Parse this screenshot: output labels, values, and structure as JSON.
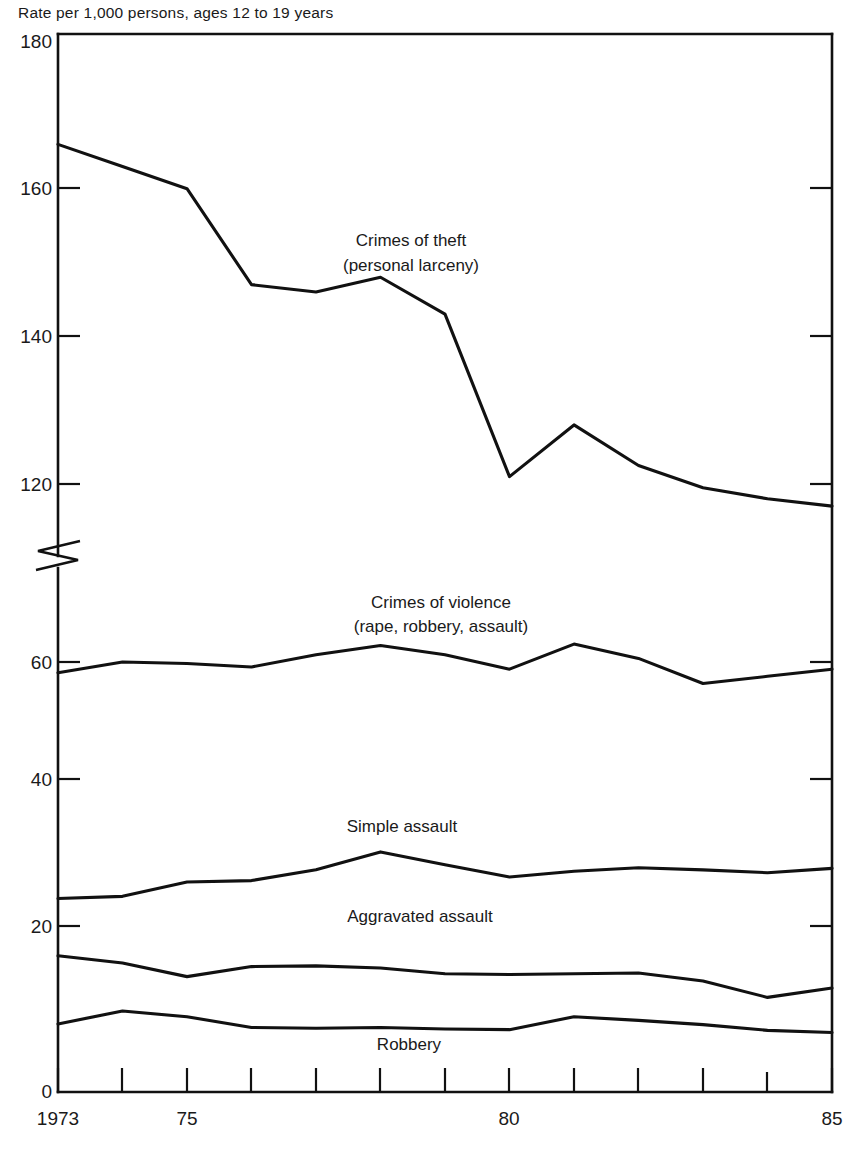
{
  "figure": {
    "subtitle": "Rate per 1,000 persons, ages 12 to 19 years"
  },
  "axes": {
    "y_ticks_upper": [
      "180",
      "160",
      "140",
      "120"
    ],
    "y_ticks_lower": [
      "60",
      "40",
      "20",
      "0"
    ],
    "x_ticks_labeled": [
      "1973",
      "75",
      "80",
      "85"
    ],
    "y_break": true
  },
  "series_labels": {
    "theft_line1": "Crimes of theft",
    "theft_line2": "(personal larceny)",
    "violence_line1": "Crimes of violence",
    "violence_line2": "(rape, robbery, assault)",
    "simple_assault": "Simple assault",
    "aggravated_assault": "Aggravated assault",
    "robbery": "Robbery"
  },
  "chart_data": {
    "type": "line",
    "title": "",
    "subtitle": "Rate per 1,000 persons, ages 12 to 19 years",
    "xlabel": "",
    "ylabel": "Rate per 1,000 persons, ages 12 to 19 years",
    "grid": false,
    "legend": "inline-annotations",
    "x": [
      1973,
      1974,
      1975,
      1976,
      1977,
      1978,
      1979,
      1980,
      1981,
      1982,
      1983,
      1984,
      1985
    ],
    "xtick_labels": {
      "1973": "1973",
      "1975": "75",
      "1980": "80",
      "1985": "85"
    },
    "y_axis_break": {
      "lower_range": [
        0,
        70
      ],
      "upper_range": [
        110,
        180
      ],
      "break_between": [
        70,
        110
      ]
    },
    "ylim_lower": [
      0,
      70
    ],
    "ylim_upper": [
      110,
      180
    ],
    "y_ticks": [
      0,
      20,
      40,
      60,
      120,
      140,
      160,
      180
    ],
    "series": [
      {
        "name": "Crimes of theft (personal larceny)",
        "values": [
          166.0,
          163.0,
          160.0,
          147.0,
          146.0,
          148.0,
          143.0,
          121.0,
          128.0,
          122.5,
          119.5,
          118.0,
          117.0
        ]
      },
      {
        "name": "Crimes of violence (rape, robbery, assault)",
        "values": [
          58.5,
          60.0,
          59.8,
          59.3,
          61.0,
          62.3,
          61.0,
          59.0,
          62.5,
          60.5,
          57.0,
          58.0,
          59.0
        ]
      },
      {
        "name": "Simple assault",
        "values": [
          27.0,
          27.3,
          29.3,
          29.5,
          31.0,
          33.5,
          31.7,
          30.0,
          30.8,
          31.3,
          31.0,
          30.6,
          31.2
        ]
      },
      {
        "name": "Aggravated assault",
        "values": [
          19.0,
          18.0,
          16.1,
          17.5,
          17.6,
          17.3,
          16.5,
          16.4,
          16.5,
          16.6,
          15.5,
          13.2,
          14.5
        ]
      },
      {
        "name": "Robbery",
        "values": [
          9.5,
          11.3,
          10.5,
          9.0,
          8.9,
          9.0,
          8.8,
          8.7,
          10.5,
          10.0,
          9.4,
          8.6,
          8.3
        ]
      }
    ]
  }
}
